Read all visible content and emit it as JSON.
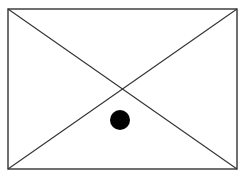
{
  "diagram": {
    "width": 243,
    "height": 178,
    "background": "#ffffff",
    "stroke_color": "#333333",
    "rect": {
      "x1": 8,
      "y1": 9,
      "x2": 237,
      "y2": 169
    },
    "dot": {
      "cx": 120,
      "cy": 120,
      "r": 10,
      "color": "#000000"
    }
  }
}
